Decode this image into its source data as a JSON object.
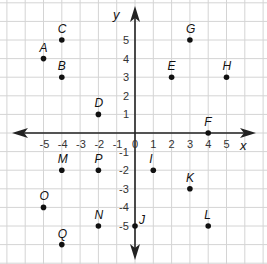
{
  "diagram": {
    "type": "coordinate-plane",
    "axes": {
      "x_label": "x",
      "y_label": "y",
      "x_ticks": [
        {
          "value": -5,
          "label": "-5"
        },
        {
          "value": -4,
          "label": "-4"
        },
        {
          "value": -3,
          "label": "-3"
        },
        {
          "value": -2,
          "label": "-2"
        },
        {
          "value": -1,
          "label": "-1"
        },
        {
          "value": 0,
          "label": "0"
        },
        {
          "value": 1,
          "label": "1"
        },
        {
          "value": 2,
          "label": "2"
        },
        {
          "value": 3,
          "label": "3"
        },
        {
          "value": 4,
          "label": "4"
        },
        {
          "value": 5,
          "label": "5"
        }
      ],
      "y_ticks": [
        {
          "value": 5,
          "label": "5"
        },
        {
          "value": 4,
          "label": "4"
        },
        {
          "value": 3,
          "label": "3"
        },
        {
          "value": 2,
          "label": "2"
        },
        {
          "value": 1,
          "label": "1"
        },
        {
          "value": -1,
          "label": "-1"
        },
        {
          "value": -2,
          "label": "-2"
        },
        {
          "value": -3,
          "label": "-3"
        },
        {
          "value": -4,
          "label": "-4"
        },
        {
          "value": -5,
          "label": "-5"
        }
      ]
    },
    "points": [
      {
        "label": "A",
        "x": -5,
        "y": 4
      },
      {
        "label": "B",
        "x": -4,
        "y": 3
      },
      {
        "label": "C",
        "x": -4,
        "y": 5
      },
      {
        "label": "D",
        "x": -2,
        "y": 1
      },
      {
        "label": "E",
        "x": 2,
        "y": 3
      },
      {
        "label": "F",
        "x": 4,
        "y": 0
      },
      {
        "label": "G",
        "x": 3,
        "y": 5
      },
      {
        "label": "H",
        "x": 5,
        "y": 3
      },
      {
        "label": "I",
        "x": 1,
        "y": -2
      },
      {
        "label": "J",
        "x": 0,
        "y": -5
      },
      {
        "label": "K",
        "x": 3,
        "y": -3
      },
      {
        "label": "L",
        "x": 4,
        "y": -5
      },
      {
        "label": "M",
        "x": -4,
        "y": -2
      },
      {
        "label": "N",
        "x": -2,
        "y": -5
      },
      {
        "label": "O",
        "x": -5,
        "y": -4
      },
      {
        "label": "P",
        "x": -2,
        "y": -2
      },
      {
        "label": "Q",
        "x": -4,
        "y": -6
      }
    ],
    "colors": {
      "grid": "#d4d4d4",
      "axis": "#222222",
      "point": "#111111"
    }
  }
}
